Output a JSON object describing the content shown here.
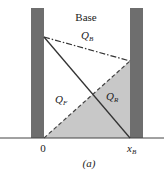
{
  "diagram": {
    "title_label": "Base",
    "labels": {
      "q_b": {
        "main": "Q",
        "sub": "B"
      },
      "q_f": {
        "main": "Q",
        "sub": "F"
      },
      "q_r": {
        "main": "Q",
        "sub": "R"
      },
      "origin": "0",
      "x_b": {
        "main": "x",
        "sub": "B"
      },
      "caption": "(a)"
    },
    "colors": {
      "bar": "#6e6e6e",
      "fill": "#c8c8c8",
      "line": "#333333",
      "background": "#ffffff"
    }
  }
}
